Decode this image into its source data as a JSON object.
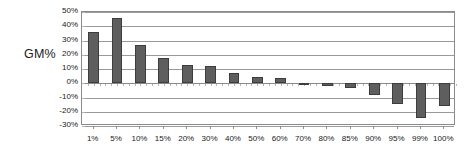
{
  "chart_data": {
    "type": "bar",
    "title": "",
    "subtitle": "",
    "xlabel": "",
    "ylabel": "GM%",
    "categories": [
      "1%",
      "5%",
      "10%",
      "15%",
      "20%",
      "30%",
      "40%",
      "50%",
      "60%",
      "70%",
      "80%",
      "85%",
      "90%",
      "95%",
      "99%",
      "100%"
    ],
    "values": [
      36,
      46,
      27,
      18,
      13,
      12,
      7,
      4.5,
      3.5,
      -1,
      -2,
      -3,
      -8,
      -14.5,
      -24.5,
      -16
    ],
    "value_labels": [
      "36%",
      "46%",
      "27%",
      "18%",
      "13%",
      "12%",
      "7%",
      "5%",
      "4%",
      "-1%",
      "-2%",
      "-3%",
      "-8%",
      "-15%",
      "-25%",
      "-16%"
    ],
    "ylim": [
      -30,
      50
    ],
    "ytick_labels": [
      "50%",
      "40%",
      "30%",
      "20%",
      "10%",
      "0%",
      "-10%",
      "-20%",
      "-30%"
    ],
    "ytick_values": [
      50,
      40,
      30,
      20,
      10,
      0,
      -10,
      -20,
      -30
    ],
    "grid": true,
    "legend": false,
    "legend_position": "none",
    "bar_color": "#5e5e5e",
    "bar_border_color": "#3d3d3d",
    "grid_color": "#9a9a9a",
    "axis_color": "#8a8a8a",
    "text_color": "#1a1a1a",
    "background": "#ffffff"
  }
}
